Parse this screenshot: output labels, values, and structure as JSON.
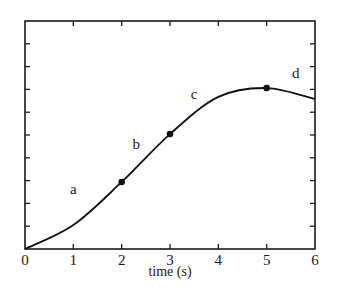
{
  "chart_data": {
    "type": "line",
    "title": "",
    "xlabel": "time (s)",
    "ylabel": "",
    "xlim": [
      0,
      6
    ],
    "ylim": [
      0,
      10
    ],
    "x_ticks": [
      "0",
      "1",
      "2",
      "3",
      "4",
      "5",
      "6"
    ],
    "y_ticks_count": 10,
    "y_tick_labels_shown": false,
    "grid": false,
    "legend": null,
    "series": [
      {
        "name": "curve",
        "x": [
          0,
          1,
          2,
          3,
          4,
          5,
          6
        ],
        "y": [
          0,
          1.05,
          2.94,
          5.04,
          6.67,
          7.06,
          6.58
        ]
      }
    ],
    "marked_points": [
      {
        "x": 2,
        "y": 2.94
      },
      {
        "x": 3,
        "y": 5.04
      },
      {
        "x": 5,
        "y": 7.06
      }
    ],
    "annotations": [
      {
        "text": "a",
        "x": 1.0,
        "y": 2.4
      },
      {
        "text": "b",
        "x": 2.3,
        "y": 4.4
      },
      {
        "text": "c",
        "x": 3.5,
        "y": 6.6
      },
      {
        "text": "d",
        "x": 5.6,
        "y": 7.5
      }
    ]
  },
  "colors": {
    "line": "#111111",
    "axis": "#1a1a1a",
    "background": "#ffffff"
  }
}
